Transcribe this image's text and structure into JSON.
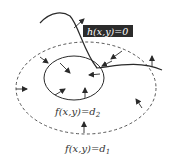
{
  "diagram": {
    "constraint_label": "h(x,y)=0",
    "inner_level_label": "f(x,y)=d",
    "inner_level_sub": "2",
    "outer_level_label": "f(x,y)=d",
    "outer_level_sub": "1",
    "colors": {
      "stroke": "#2a2a2a",
      "label_box_bg": "#2b2b2b",
      "label_box_text": "#ffffff",
      "dashed": "#444444"
    }
  }
}
